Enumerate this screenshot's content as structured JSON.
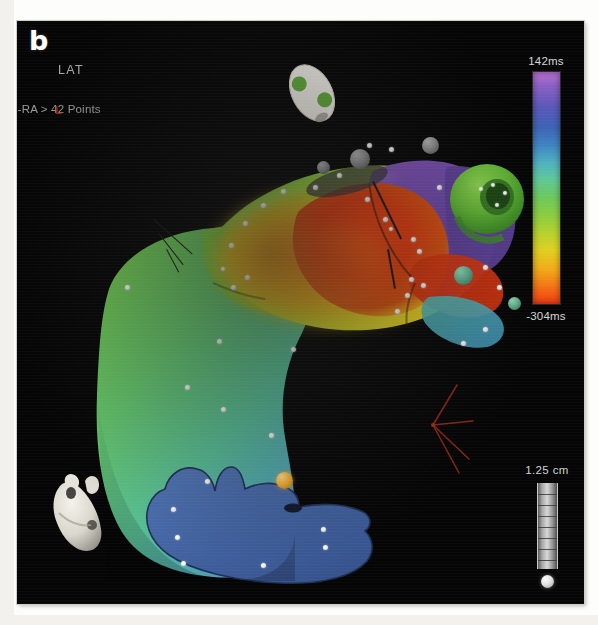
{
  "figure": {
    "panel_letter": "b",
    "map_title": "LAT",
    "breadcrumb": "1-RA > 42 Points"
  },
  "color_scale": {
    "name": "lat-colorbar",
    "max_label": "142ms",
    "min_label": "-304ms",
    "unit": "ms",
    "max_value": 142,
    "min_value": -304,
    "orientation": "vertical",
    "stops": [
      "#b96fd0",
      "#8a5fc4",
      "#5a57b8",
      "#3c63b4",
      "#3f86c0",
      "#4fb0c0",
      "#5ec79a",
      "#6cc85c",
      "#8ccd3e",
      "#b9d22c",
      "#e0cf20",
      "#f2ab18",
      "#f37715",
      "#ef3a12"
    ]
  },
  "distance_scale": {
    "label": "1.25 cm",
    "value": 1.25,
    "unit": "cm",
    "tick_count": 7
  },
  "orientation_axes": {
    "label": "L",
    "color": "#9a2a18",
    "axis_count": 3
  },
  "heart_model": {
    "name": "heart-orientation-model",
    "color": "#e8e6df"
  },
  "canvas": {
    "background": "#050505",
    "border_color": "#cfcdc8"
  },
  "annotations": [
    {
      "name": "tissue-pointer",
      "type": "line-pointer",
      "color": "#1b1b14"
    },
    {
      "name": "lesion-pointer",
      "type": "line-pointer",
      "color": "#1b1b14"
    }
  ],
  "mesh": {
    "name": "right-atrium-lat-map",
    "point_count": 42,
    "regions": [
      {
        "name": "late-activation-purple",
        "color": "#6a4aa8"
      },
      {
        "name": "early-activation-red",
        "color": "#d8380f"
      },
      {
        "name": "mid-activation-green",
        "color": "#6fc24a"
      },
      {
        "name": "low-voltage-blue",
        "color": "#4a6ba8"
      }
    ]
  },
  "markers": {
    "grey_spheres": 3,
    "green_spheres": 3,
    "amber_sphere": 1,
    "white_points": 42
  }
}
